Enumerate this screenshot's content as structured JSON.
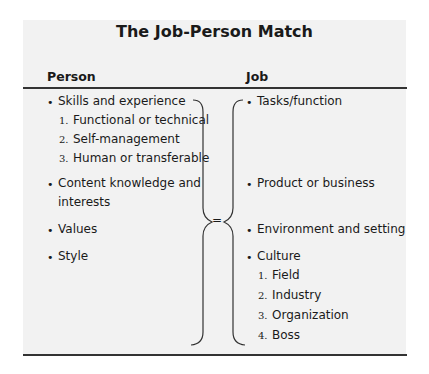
{
  "title": "The Job-Person Match",
  "columns": {
    "person": {
      "header": "Person"
    },
    "job": {
      "header": "Job"
    }
  },
  "person_items": [
    {
      "label": "Skills and experience",
      "subitems": [
        {
          "num": "1.",
          "label": "Functional or technical"
        },
        {
          "num": "2.",
          "label": "Self-management"
        },
        {
          "num": "3.",
          "label": "Human or transferable"
        }
      ]
    },
    {
      "label": "Content knowledge and",
      "label_line2": "interests"
    },
    {
      "label": "Values"
    },
    {
      "label": "Style"
    }
  ],
  "job_items": [
    {
      "label": "Tasks/function"
    },
    {
      "label": "Product or business"
    },
    {
      "label": "Environment and setting"
    },
    {
      "label": "Culture",
      "subitems": [
        {
          "num": "1.",
          "label": "Field"
        },
        {
          "num": "2.",
          "label": "Industry"
        },
        {
          "num": "3.",
          "label": "Organization"
        },
        {
          "num": "4.",
          "label": "Boss"
        }
      ]
    }
  ],
  "connector": {
    "symbol": "="
  },
  "bullet": "•"
}
